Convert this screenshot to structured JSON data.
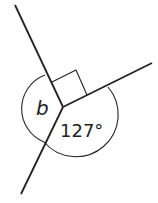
{
  "diagram": {
    "type": "angles-around-a-point",
    "labels": {
      "unknown_angle": "b",
      "known_angle": "127°"
    },
    "right_angle_marker": true,
    "colors": {
      "line": "#222222",
      "background": "#ffffff"
    }
  }
}
